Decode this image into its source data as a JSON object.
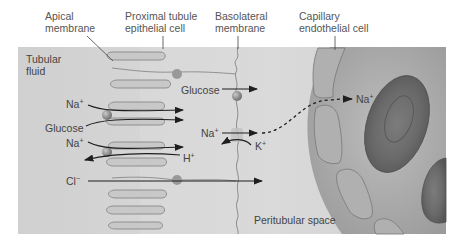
{
  "labels": {
    "apical_membrane": [
      "Apical",
      "membrane"
    ],
    "proximal_tubule_cell": [
      "Proximal tubule",
      "epithelial cell"
    ],
    "basolateral_membrane": [
      "Basolateral",
      "membrane"
    ],
    "capillary_endothelial_cell": [
      "Capillary",
      "endothelial cell"
    ],
    "tubular_fluid": [
      "Tubular",
      "fluid"
    ],
    "peritubular_space": "Peritubular space"
  },
  "apical_transport": {
    "na_1": "Na",
    "na_1_charge": "+",
    "glucose": "Glucose",
    "na_2": "Na",
    "na_2_charge": "+",
    "h": "H",
    "h_charge": "+",
    "cl": "Cl",
    "cl_charge": "−"
  },
  "basolateral_transport": {
    "glucose": "Glucose",
    "na": "Na",
    "na_charge": "+",
    "k": "K",
    "k_charge": "+",
    "na_blood": "Na",
    "na_blood_charge": "+"
  },
  "colors": {
    "panel_bg": "#d6d6d6",
    "cell_interior": "#dcdcdc",
    "membrane_line": "#8a8a8a",
    "microvilli_fill": "#c4c4c4",
    "transporter": "#8f8f8f",
    "capillary_lumen": "#b4b4b4",
    "endothelial_cell": "#a8a8a8",
    "red_blood_cell": "#6e6e6e",
    "arrow": "#1e1e1e"
  }
}
